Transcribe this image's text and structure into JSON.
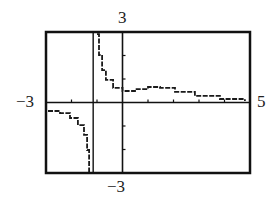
{
  "chart_data": {
    "type": "line",
    "title": "",
    "xlabel": "",
    "ylabel": "",
    "xlim": [
      -3,
      5
    ],
    "ylim": [
      -3,
      3
    ],
    "grid": false,
    "legend": null,
    "window_labels": {
      "xmin": "−3",
      "xmax": "5",
      "ymin": "−3",
      "ymax": "3"
    },
    "x_ticks": [
      -3,
      -2,
      -1,
      1,
      2,
      3,
      4
    ],
    "y_ticks": [
      -3,
      -2,
      -1,
      1,
      2,
      3
    ],
    "vertical_asymptote_x": -1.15,
    "horizontal_asymptote_y": 0,
    "series": [
      {
        "name": "left branch",
        "x": [
          -2.92,
          -2.45,
          -2.06,
          -1.75,
          -1.51,
          -1.39,
          -1.31
        ],
        "y": [
          -0.36,
          -0.45,
          -0.66,
          -0.96,
          -1.38,
          -2.02,
          -2.96
        ]
      },
      {
        "name": "right branch",
        "x": [
          -1.0,
          -0.92,
          -0.8,
          -0.65,
          -0.37,
          0.0,
          0.49,
          1.0,
          1.47,
          2.06,
          2.84,
          3.82,
          4.8
        ],
        "y": [
          2.91,
          2.02,
          1.38,
          0.96,
          0.62,
          0.49,
          0.57,
          0.66,
          0.62,
          0.45,
          0.28,
          0.15,
          0.06
        ]
      }
    ],
    "colors": {
      "curve": "#1a1a1a",
      "frame": "#111111",
      "axes": "#111111",
      "background": "#ffffff"
    }
  }
}
